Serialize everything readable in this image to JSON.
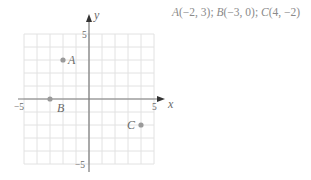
{
  "caption": {
    "A": "A",
    "A_coords": "(−2, 3); ",
    "B": "B",
    "B_coords": "(−3, 0); ",
    "C": "C",
    "C_coords": "(4, −2)"
  },
  "axes": {
    "x_label": "x",
    "y_label": "y",
    "x_min_tick": "−5",
    "x_max_tick": "5",
    "y_max_tick": "5",
    "y_min_tick": "−5"
  },
  "points": [
    {
      "label": "A",
      "x": -2,
      "y": 3
    },
    {
      "label": "B",
      "x": -3,
      "y": 0
    },
    {
      "label": "C",
      "x": 4,
      "y": -2
    }
  ],
  "colors": {
    "grid": "#e2e2e2",
    "axis": "#7a7a7a",
    "point": "#9a9a9a",
    "text": "#6a6a6a"
  },
  "chart_data": {
    "type": "scatter",
    "title": "",
    "xlabel": "x",
    "ylabel": "y",
    "xlim": [
      -5,
      5
    ],
    "ylim": [
      -5,
      5
    ],
    "grid": true,
    "x_ticks": [
      "-5",
      "5"
    ],
    "y_ticks": [
      "5",
      "-5"
    ],
    "series": [
      {
        "name": "points",
        "points": [
          {
            "label": "A",
            "x": -2,
            "y": 3
          },
          {
            "label": "B",
            "x": -3,
            "y": 0
          },
          {
            "label": "C",
            "x": 4,
            "y": -2
          }
        ]
      }
    ],
    "annotations": [
      "A(-2, 3); B(-3, 0); C(4, -2)"
    ]
  }
}
